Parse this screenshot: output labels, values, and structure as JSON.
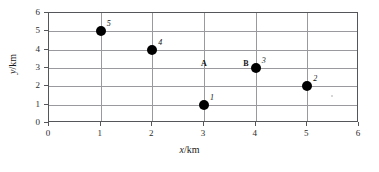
{
  "chart_data": {
    "type": "scatter",
    "title": "",
    "xlabel": "x/km",
    "ylabel": "y/km",
    "xlim": [
      0,
      6
    ],
    "ylim": [
      0,
      6
    ],
    "x_ticks": [
      0,
      1,
      2,
      3,
      4,
      5,
      6
    ],
    "y_ticks": [
      0,
      1,
      2,
      3,
      4,
      5,
      6
    ],
    "grid": true,
    "legend": "none",
    "marker_color": "#000000",
    "grid_color": "#9a9a9e",
    "axis_color": "#55565a",
    "points": [
      {
        "label": "5",
        "x": 1,
        "y": 5
      },
      {
        "label": "4",
        "x": 2,
        "y": 4
      },
      {
        "label": "3",
        "x": 4,
        "y": 3
      },
      {
        "label": "2",
        "x": 5,
        "y": 2
      },
      {
        "label": "1",
        "x": 3,
        "y": 1
      }
    ],
    "annotations": [
      {
        "label": "A",
        "x": 3,
        "y": 3.22
      },
      {
        "label": "B",
        "x": 3.82,
        "y": 3.22
      }
    ]
  }
}
